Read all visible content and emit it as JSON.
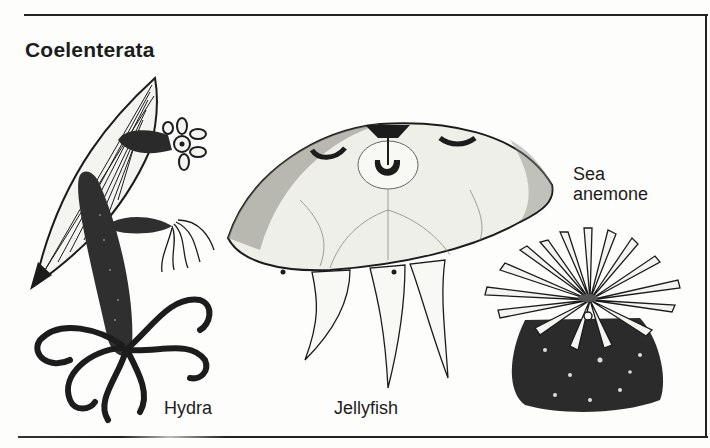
{
  "figure": {
    "title": "Coelenterata",
    "labels": {
      "hydra": "Hydra",
      "jellyfish": "Jellyfish",
      "sea_anemone_line1": "Sea",
      "sea_anemone_line2": "anemone"
    },
    "illustrations": [
      "hydra-illustration",
      "jellyfish-illustration",
      "sea-anemone-illustration"
    ],
    "colors": {
      "ink": "#1c1c1c",
      "paper": "#fdfdfb"
    }
  }
}
